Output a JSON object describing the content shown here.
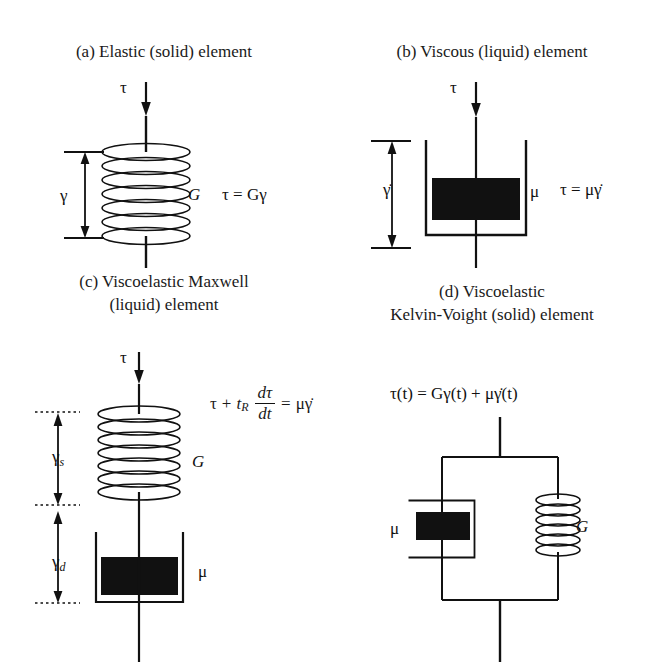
{
  "figure": {
    "ink_color": "#111111",
    "background": "#ffffff"
  },
  "panels": [
    {
      "id": "a",
      "title": "(a) Elastic (solid) element",
      "model": "spring",
      "stress_label": "τ",
      "strain_label": "γ",
      "modulus_label": "G",
      "equation": "τ = Gγ",
      "coil_turns": 7
    },
    {
      "id": "b",
      "title": "(b) Viscous (liquid) element",
      "model": "dashpot",
      "stress_label": "τ",
      "strain_rate_label": "γ̇",
      "viscosity_label": "μ",
      "equation": "τ = μγ̇"
    },
    {
      "id": "c",
      "title": "(c) Viscoelastic Maxwell\n(liquid) element",
      "model": "maxwell-series",
      "stress_label": "τ",
      "spring_strain_label": "γ",
      "spring_strain_sub": "s",
      "dashpot_strain_label": "γ",
      "dashpot_strain_sub": "d",
      "modulus_label": "G",
      "viscosity_label": "μ",
      "equation": {
        "lhs_tau": "τ",
        "plus": "+",
        "relax_time": "t",
        "relax_time_sub": "R",
        "frac_num": "dτ",
        "frac_den": "dt",
        "equals": "=",
        "rhs": "μγ̇",
        "full": "τ + t_R dτ/dt = μγ̇"
      },
      "coil_turns": 7
    },
    {
      "id": "d",
      "title": "(d) Viscoelastic\nKelvin-Voight (solid) element",
      "model": "kelvin-voigt-parallel",
      "viscosity_label": "μ",
      "modulus_label": "G",
      "equation": "τ(t) = Gγ(t) + μγ̇(t)",
      "coil_turns": 7
    }
  ]
}
